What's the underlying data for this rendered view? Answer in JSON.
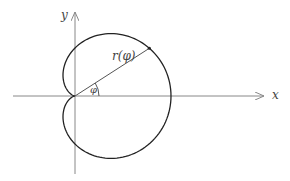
{
  "diagram": {
    "curve": "cardioid r = a(1 + cos φ)",
    "axes": {
      "x_label": "x",
      "y_label": "y"
    },
    "labels": {
      "radius": "r(φ)",
      "angle": "φ"
    },
    "geometry": {
      "origin": [
        75,
        96
      ],
      "a": 48,
      "phi_deg": 32.7
    },
    "colors": {
      "axis": "#888888",
      "curve": "#222222",
      "text": "#444444"
    }
  }
}
